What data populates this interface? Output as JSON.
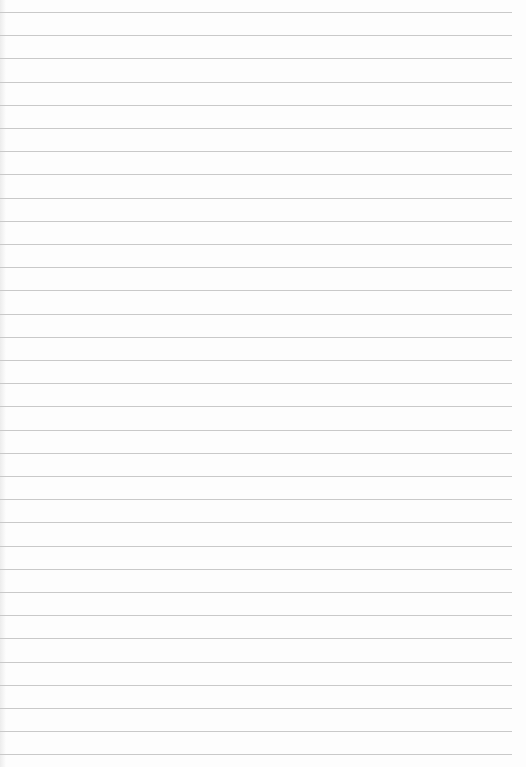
{
  "paper": {
    "type": "lined-paper",
    "background_color": "#fdfdfd",
    "line_color": "#c9c9c9",
    "line_count": 33,
    "first_line_y": 12,
    "line_spacing_px": 23.2,
    "line_width_px": 512
  }
}
